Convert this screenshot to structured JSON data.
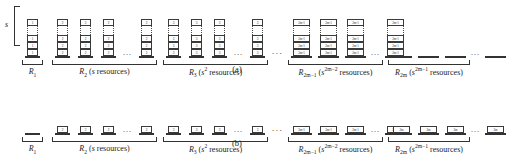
{
  "figure": {
    "panels": [
      {
        "id": "a",
        "caption": "(a)",
        "height_brace_label": "s",
        "groups": [
          {
            "name": "R1",
            "label_main": "R",
            "label_sub": "1",
            "label_suffix": "",
            "columns": 1,
            "visible_columns": 1,
            "has_ellipsis": false,
            "stack_type": "tall",
            "cell_labels": [
              "1",
              "1",
              "1",
              "1"
            ],
            "left": 22,
            "width": 21
          },
          {
            "name": "R2",
            "label_main": "R",
            "label_sub": "2",
            "label_suffix": "(s resources)",
            "columns": 4,
            "visible_columns": 4,
            "has_ellipsis": true,
            "stack_type": "tall",
            "cell_labels": [
              "2",
              "2",
              "2",
              "2"
            ],
            "left": 52,
            "width": 105
          },
          {
            "name": "R3",
            "label_main": "R",
            "label_sub": "3",
            "label_suffix": "(s^2 resources)",
            "columns": 4,
            "visible_columns": 4,
            "has_ellipsis": true,
            "stack_type": "tall",
            "cell_labels": [
              "3",
              "3",
              "3",
              "3"
            ],
            "left": 163,
            "width": 105
          },
          {
            "name": "R2m-1",
            "label_main": "R",
            "label_sub": "2m-1",
            "label_suffix": "(s^2m-2 resources)",
            "columns": 4,
            "visible_columns": 4,
            "has_ellipsis": true,
            "stack_type": "tall-wide",
            "cell_labels": [
              "2m-1",
              "2m-1",
              "2m-1",
              "2m-1"
            ],
            "left": 288,
            "width": 95
          },
          {
            "name": "R2m",
            "label_main": "R",
            "label_sub": "2m",
            "label_suffix": "(s^2m-1 resources)",
            "columns": 4,
            "visible_columns": 4,
            "has_ellipsis": true,
            "stack_type": "dash-wide",
            "cell_labels": [],
            "left": 388,
            "width": 82
          }
        ],
        "separators": [
          {
            "left": 272,
            "text": "..."
          }
        ]
      },
      {
        "id": "b",
        "caption": "(b)",
        "height_brace_label": "",
        "groups": [
          {
            "name": "R1",
            "label_main": "R",
            "label_sub": "1",
            "label_suffix": "",
            "columns": 1,
            "visible_columns": 1,
            "has_ellipsis": false,
            "stack_type": "dash",
            "cell_labels": [],
            "left": 22,
            "width": 21
          },
          {
            "name": "R2",
            "label_main": "R",
            "label_sub": "2",
            "label_suffix": "(s resources)",
            "columns": 4,
            "visible_columns": 4,
            "has_ellipsis": true,
            "stack_type": "single",
            "cell_labels": [
              "2",
              "2",
              "2",
              "2"
            ],
            "left": 52,
            "width": 105
          },
          {
            "name": "R3",
            "label_main": "R",
            "label_sub": "3",
            "label_suffix": "(s^2 resources)",
            "columns": 4,
            "visible_columns": 4,
            "has_ellipsis": true,
            "stack_type": "single",
            "cell_labels": [
              "3",
              "3",
              "3",
              "3"
            ],
            "left": 163,
            "width": 105
          },
          {
            "name": "R2m-1",
            "label_main": "R",
            "label_sub": "2m-1",
            "label_suffix": "(s^2m-2 resources)",
            "columns": 4,
            "visible_columns": 4,
            "has_ellipsis": true,
            "stack_type": "single-wide",
            "cell_labels": [
              "2m-1",
              "2m-1",
              "2m-1",
              "2m-1"
            ],
            "left": 288,
            "width": 95
          },
          {
            "name": "R2m",
            "label_main": "R",
            "label_sub": "2m",
            "label_suffix": "(s^2m-1 resources)",
            "columns": 4,
            "visible_columns": 4,
            "has_ellipsis": true,
            "stack_type": "single-wide",
            "cell_labels": [
              "2m",
              "2m",
              "2m",
              "2m"
            ],
            "left": 388,
            "width": 82
          }
        ],
        "separators": [
          {
            "left": 272,
            "text": "..."
          }
        ]
      }
    ],
    "text": {
      "resources_word": "resources",
      "ellipsis": ". . .",
      "inner_ellipsis": "..."
    }
  }
}
